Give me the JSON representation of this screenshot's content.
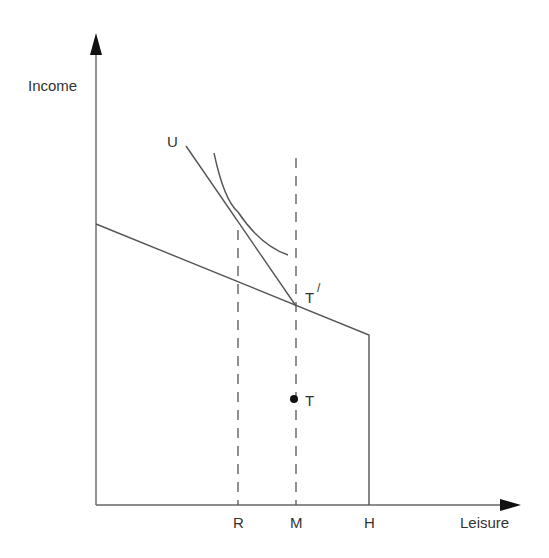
{
  "diagram": {
    "axes": {
      "y_label": "Income",
      "x_label": "Leisure"
    },
    "x_ticks": [
      {
        "label": "R"
      },
      {
        "label": "M"
      },
      {
        "label": "H"
      }
    ],
    "points": {
      "t_prime": "T",
      "t_prime_mark": "/",
      "t": "T"
    },
    "curves": {
      "indifference": "U"
    },
    "colors": {
      "line": "#555555",
      "text": "#333333",
      "background": "#ffffff"
    }
  }
}
